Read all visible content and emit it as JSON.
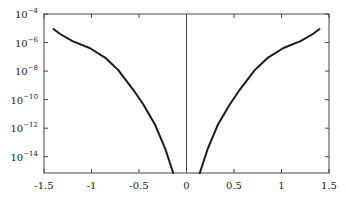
{
  "chart_data": {
    "type": "line",
    "title": "",
    "xlabel": "",
    "ylabel": "",
    "xlim": [
      -1.5,
      1.5
    ],
    "ylim_log10": [
      -15.14,
      -4
    ],
    "yscale": "log",
    "grid": false,
    "legend": null,
    "x_ticks": [
      -1.5,
      -1,
      -0.5,
      0,
      0.5,
      1,
      1.5
    ],
    "x_tick_labels": [
      "-1.5",
      "-1",
      "-0.5",
      "0",
      "0.5",
      "1",
      "1.5"
    ],
    "y_ticks_log10": [
      -4,
      -6,
      -8,
      -10,
      -12,
      -14
    ],
    "y_tick_labels": [
      "10^-4",
      "10^-6",
      "10^-8",
      "10^-10",
      "10^-12",
      "10^-14"
    ],
    "annotations": [
      {
        "type": "vertical_line",
        "x": 0
      }
    ],
    "series": [
      {
        "name": "left branch",
        "x": [
          -1.4,
          -1.33,
          -1.2,
          -1.02,
          -0.85,
          -0.72,
          -0.56,
          -0.45,
          -0.33,
          -0.22,
          -0.14
        ],
        "log10_y": [
          -5.05,
          -5.4,
          -5.9,
          -6.38,
          -7.1,
          -7.92,
          -9.31,
          -10.4,
          -11.76,
          -13.51,
          -15.14
        ]
      },
      {
        "name": "right branch",
        "x": [
          0.14,
          0.22,
          0.33,
          0.45,
          0.56,
          0.72,
          0.85,
          1.02,
          1.2,
          1.33,
          1.4
        ],
        "log10_y": [
          -15.14,
          -13.51,
          -11.76,
          -10.4,
          -9.31,
          -7.92,
          -7.1,
          -6.38,
          -5.9,
          -5.4,
          -5.05
        ]
      }
    ]
  },
  "colors": {
    "axis": "#444444",
    "curve": "#1a1a1a",
    "text": "#222222"
  }
}
